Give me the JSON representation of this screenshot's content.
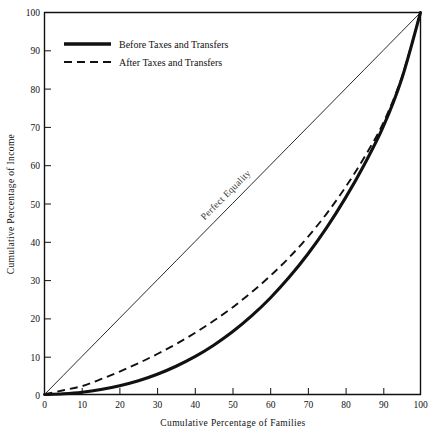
{
  "chart_data": {
    "type": "line",
    "title": "",
    "xlabel": "Cumulative Percentage of Families",
    "ylabel": "Cumulative Percentage of Income",
    "xlim": [
      0,
      100
    ],
    "ylim": [
      0,
      100
    ],
    "grid": false,
    "legend_position": "upper-left-inside",
    "xticks": [
      "0",
      "10",
      "20",
      "30",
      "40",
      "50",
      "60",
      "70",
      "80",
      "90",
      "100"
    ],
    "yticks": [
      "0",
      "10",
      "20",
      "30",
      "40",
      "50",
      "60",
      "70",
      "80",
      "90",
      "100"
    ],
    "x": [
      0,
      5,
      10,
      15,
      20,
      25,
      30,
      35,
      40,
      45,
      50,
      55,
      60,
      65,
      70,
      75,
      80,
      85,
      90,
      95,
      100
    ],
    "series": [
      {
        "name": "Perfect Equality",
        "style": "thin-solid",
        "color": "#111111",
        "values": [
          0,
          5,
          10,
          15,
          20,
          25,
          30,
          35,
          40,
          45,
          50,
          55,
          60,
          65,
          70,
          75,
          80,
          85,
          90,
          95,
          100
        ]
      },
      {
        "name": "Before Taxes and Transfers",
        "style": "thick-solid",
        "color": "#111111",
        "values": [
          0,
          0.2,
          0.6,
          1.3,
          2.3,
          3.6,
          5.3,
          7.4,
          9.9,
          12.9,
          16.4,
          20.5,
          25.2,
          30.6,
          36.7,
          43.6,
          51.4,
          60.1,
          69.9,
          82.6,
          100
        ]
      },
      {
        "name": "After Taxes and Transfers",
        "style": "dashed",
        "color": "#111111",
        "values": [
          0,
          1.1,
          2.2,
          4.0,
          6.0,
          8.2,
          10.6,
          13.2,
          16.1,
          19.3,
          22.8,
          26.7,
          31.0,
          35.8,
          41.2,
          47.3,
          54.2,
          62.0,
          70.9,
          83.0,
          100
        ]
      }
    ],
    "annotations": [
      {
        "text": "Perfect Equality",
        "x": 40,
        "y": 40,
        "rotation": -45
      }
    ]
  },
  "legend": {
    "entries": [
      {
        "label": "Before Taxes and Transfers",
        "style": "thick-solid"
      },
      {
        "label": "After Taxes and Transfers",
        "style": "dashed"
      }
    ]
  },
  "axes": {
    "x_title": "Cumulative Percentage of Families",
    "y_title": "Cumulative Percentage of Income",
    "x_tick_labels": [
      "0",
      "10",
      "20",
      "30",
      "40",
      "50",
      "60",
      "70",
      "80",
      "90",
      "100"
    ],
    "y_tick_labels": [
      "0",
      "10",
      "20",
      "30",
      "40",
      "50",
      "60",
      "70",
      "80",
      "90",
      "100"
    ]
  },
  "colors": {
    "background": "#ffffff",
    "ink": "#111111",
    "annotation": "#333333"
  }
}
